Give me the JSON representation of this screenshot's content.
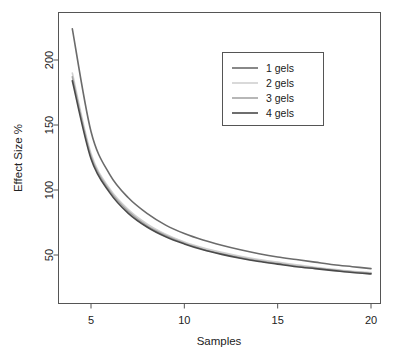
{
  "chart_data": {
    "type": "line",
    "title": "",
    "subtitle": "",
    "xlabel": "Samples",
    "ylabel": "Effect Size %",
    "xlim": [
      4,
      20
    ],
    "ylim": [
      31,
      228
    ],
    "grid": false,
    "xticks": [
      5,
      10,
      15,
      20
    ],
    "xtick_labels": [
      "5",
      "10",
      "15",
      "20"
    ],
    "yticks": [
      50,
      100,
      150,
      200
    ],
    "ytick_labels": [
      "50",
      "100",
      "150",
      "200"
    ],
    "legend_position": "top-right",
    "x": [
      4,
      5,
      6,
      7,
      8,
      9,
      10,
      11,
      12,
      13,
      14,
      15,
      16,
      17,
      18,
      19,
      20
    ],
    "series": [
      {
        "name": "1 gels",
        "color": "#6b6b6b",
        "values": [
          224,
          145,
          112,
          94,
          82,
          73,
          66.5,
          61.5,
          57.5,
          54,
          51,
          48.5,
          46.5,
          44.5,
          42.5,
          41,
          39.5
        ]
      },
      {
        "name": "2 gels",
        "color": "#d0d0d0",
        "values": [
          190,
          128,
          101,
          85,
          74,
          66,
          60,
          55.5,
          52,
          49,
          46.5,
          44.5,
          42.5,
          40.5,
          39,
          37.5,
          36.5
        ]
      },
      {
        "name": "3 gels",
        "color": "#a5a5a5",
        "values": [
          187,
          126,
          99.5,
          83.5,
          72.5,
          65,
          59,
          54.5,
          51,
          48,
          45.5,
          43.5,
          41.5,
          40,
          38.5,
          37,
          36
        ]
      },
      {
        "name": "4 gels",
        "color": "#4a4a4a",
        "values": [
          184,
          124,
          98,
          82,
          71.5,
          64,
          58.5,
          54,
          50.5,
          47.5,
          45,
          43,
          41,
          39.5,
          38,
          36.5,
          35.5
        ]
      }
    ]
  },
  "legend": {
    "entries": [
      {
        "label": "1 gels"
      },
      {
        "label": "2 gels"
      },
      {
        "label": "3 gels"
      },
      {
        "label": "4 gels"
      }
    ]
  },
  "axes": {
    "x_title": "Samples",
    "y_title": "Effect Size %"
  }
}
